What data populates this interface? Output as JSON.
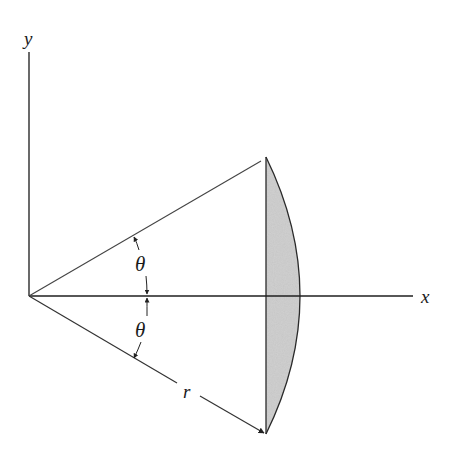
{
  "figure": {
    "labels": {
      "y_axis": "y",
      "x_axis": "x",
      "theta_upper": "θ",
      "theta_lower": "θ",
      "radius": "r"
    },
    "geometry": {
      "origin": [
        29,
        296
      ],
      "upper_endpoint": [
        266,
        157
      ],
      "lower_endpoint": [
        266,
        434
      ],
      "arc_apex": [
        314,
        296
      ],
      "x_axis_end": 413,
      "y_axis_top": 52
    },
    "colors": {
      "line": "#2a2a2a",
      "segment_fill": "#cfcfcf"
    }
  }
}
